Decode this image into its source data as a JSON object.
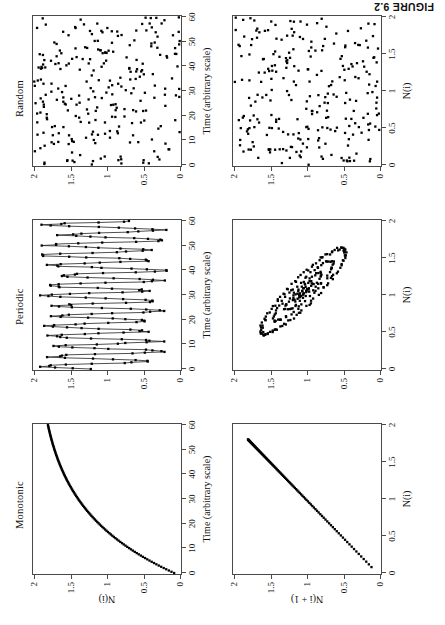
{
  "figure": {
    "caption": "FIGURE 9.2",
    "rotation_degrees": -90,
    "grid": {
      "rows": 2,
      "cols": 3
    }
  },
  "panel_titles": [
    "Monotonic",
    "Periodic",
    "Random"
  ],
  "axis_titles": {
    "time": "Time (arbitrary scale)",
    "n_i": "N(i)",
    "n_i_plus_1": "N(i + 1)"
  },
  "ticks": {
    "time": [
      "0",
      "10",
      "20",
      "30",
      "40",
      "50",
      "60"
    ],
    "value": [
      "0",
      "0.5",
      "1",
      "1.5",
      "2"
    ]
  },
  "chart_data": [
    {
      "id": "monotonic-timeseries",
      "type": "scatter",
      "title": "Monotonic",
      "xlabel": "Time (arbitrary scale)",
      "ylabel": "N(i)",
      "xlim": [
        0,
        60
      ],
      "ylim": [
        0,
        2
      ],
      "xticks": [
        0,
        10,
        20,
        30,
        40,
        50,
        60
      ],
      "yticks": [
        0,
        0.5,
        1,
        1.5,
        2
      ],
      "grid": false,
      "legend": "none",
      "description": "Monotonically increasing saturating curve from near 0 at t=0 to 2 at t=60; dense dots, sparse at low t.",
      "model": "exponential-approach",
      "params": {
        "y0": 0.08,
        "ymax": 2.0,
        "tau": 26.0
      },
      "n_points": 120
    },
    {
      "id": "monotonic-returnmap",
      "type": "scatter",
      "title": "Monotonic",
      "xlabel": "N(i)",
      "ylabel": "N(i + 1)",
      "xlim": [
        0,
        2
      ],
      "ylim": [
        0,
        2
      ],
      "xticks": [
        0,
        0.5,
        1,
        1.5,
        2
      ],
      "yticks": [
        0,
        0.5,
        1,
        1.5,
        2
      ],
      "grid": false,
      "legend": "none",
      "description": "Near-diagonal line of points from (0.08,0.12) to (2,2); points densest near the top-right.",
      "model": "diagonal",
      "n_points": 120
    },
    {
      "id": "periodic-timeseries",
      "type": "line",
      "title": "Periodic",
      "xlabel": "Time (arbitrary scale)",
      "ylabel": "N(i)",
      "xlim": [
        0,
        60
      ],
      "ylim": [
        0,
        2
      ],
      "xticks": [
        0,
        10,
        20,
        30,
        40,
        50,
        60
      ],
      "yticks": [
        0,
        0.5,
        1,
        1.5,
        2
      ],
      "grid": false,
      "legend": "none",
      "description": "Connected dots oscillating quasi-periodically between about 0.25 and 1.85 with a period of roughly 4 time units.",
      "model": "noisy-oscillation",
      "params": {
        "mean": 1.05,
        "amplitude": 0.72,
        "period": 4.1,
        "noise": 0.13
      },
      "n_points": 200
    },
    {
      "id": "periodic-returnmap",
      "type": "scatter",
      "title": "Periodic",
      "xlabel": "N(i)",
      "ylabel": "N(i + 1)",
      "xlim": [
        0,
        2
      ],
      "ylim": [
        0,
        2
      ],
      "xticks": [
        0,
        0.5,
        1,
        1.5,
        2
      ],
      "yticks": [
        0,
        0.5,
        1,
        1.5,
        2
      ],
      "grid": false,
      "legend": "none",
      "description": "Elongated anti-diagonal elliptical loop (attractor) running from about (0.3,1.8) to (1.8,0.3), with nested inner rings and a dense core near (1.05,1.05).",
      "model": "tilted-ellipse-family",
      "params": {
        "center": [
          1.05,
          1.05
        ],
        "tilt_degrees": -45,
        "semi_major": 0.78,
        "semi_minor": 0.17
      },
      "n_points": 240
    },
    {
      "id": "random-timeseries",
      "type": "scatter",
      "title": "Random",
      "xlabel": "Time (arbitrary scale)",
      "ylabel": "N(i)",
      "xlim": [
        0,
        60
      ],
      "ylim": [
        0,
        2
      ],
      "xticks": [
        0,
        10,
        20,
        30,
        40,
        50,
        60
      ],
      "yticks": [
        0,
        0.5,
        1,
        1.5,
        2
      ],
      "grid": false,
      "legend": "none",
      "description": "Uniformly scattered points filling the full box, no structure.",
      "model": "uniform-random",
      "n_points": 260
    },
    {
      "id": "random-returnmap",
      "type": "scatter",
      "title": "Random",
      "xlabel": "N(i)",
      "ylabel": "N(i + 1)",
      "xlim": [
        0,
        2
      ],
      "ylim": [
        0,
        2
      ],
      "xticks": [
        0,
        0.5,
        1,
        1.5,
        2
      ],
      "yticks": [
        0,
        0.5,
        1,
        1.5,
        2
      ],
      "grid": false,
      "legend": "none",
      "description": "Uniformly scattered points filling the unit-square return map, no structure.",
      "model": "uniform-random",
      "n_points": 260
    }
  ]
}
